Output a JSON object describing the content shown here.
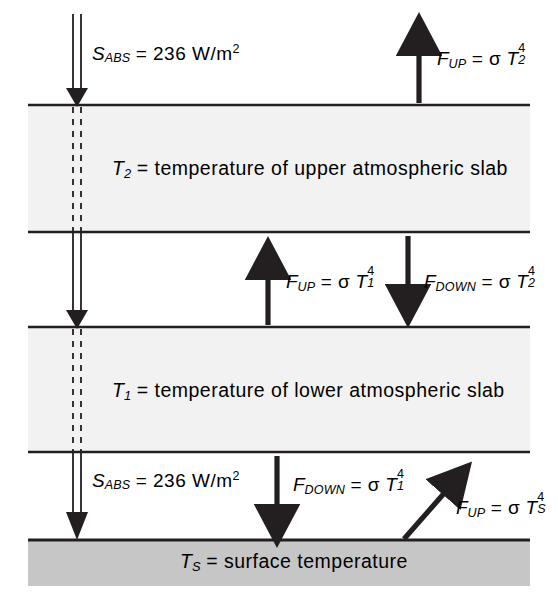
{
  "figure": {
    "type": "two-slab-atmosphere-energy-balance-diagram",
    "background_color": "#ffffff",
    "line_color": "#231f20",
    "slab_fill_color": "#f2f2f2",
    "surface_fill_color": "#c6c6c6"
  },
  "layers": {
    "upper_slab": {
      "name": "upper atmospheric slab",
      "label_symbol": "T",
      "label_subscript": "2",
      "label_text": "= temperature of upper atmospheric slab",
      "full_text": "T2 = temperature of upper atmospheric slab",
      "top_y": 105,
      "bottom_y": 232
    },
    "lower_slab": {
      "name": "lower atmospheric slab",
      "label_symbol": "T",
      "label_subscript": "1",
      "label_text": "= temperature of lower atmospheric slab",
      "full_text": "T1 = temperature of lower atmospheric slab",
      "top_y": 327,
      "bottom_y": 452
    },
    "surface": {
      "name": "surface",
      "label_symbol": "T",
      "label_subscript": "S",
      "label_text": "= surface temperature",
      "full_text": "TS = surface temperature",
      "top_y": 540,
      "bottom_y": 586
    }
  },
  "fluxes": [
    {
      "id": "solar-top",
      "symbol": "S",
      "subscript": "ABS",
      "equals": "=",
      "value": "236",
      "units": "W/m",
      "units_exponent": "2",
      "full_text": "SABS = 236 W/m2",
      "direction": "down",
      "arrow_style": "double-line",
      "location": "top-of-atmosphere"
    },
    {
      "id": "fup-toa",
      "symbol": "F",
      "subscript": "UP",
      "equals": "=",
      "sigma": "σ",
      "temp_symbol": "T",
      "temp_subscript": "2",
      "temp_exponent": "4",
      "full_text": "FUP = σ T2^4",
      "direction": "up",
      "arrow_style": "solid",
      "location": "top-of-upper-slab"
    },
    {
      "id": "fup-mid",
      "symbol": "F",
      "subscript": "UP",
      "equals": "=",
      "sigma": "σ",
      "temp_symbol": "T",
      "temp_subscript": "1",
      "temp_exponent": "4",
      "full_text": "FUP = σ T1^4",
      "direction": "up",
      "arrow_style": "solid",
      "location": "between-slabs"
    },
    {
      "id": "fdown-mid",
      "symbol": "F",
      "subscript": "DOWN",
      "equals": "=",
      "sigma": "σ",
      "temp_symbol": "T",
      "temp_subscript": "2",
      "temp_exponent": "4",
      "full_text": "FDOWN = σ T2^4",
      "direction": "down",
      "arrow_style": "solid",
      "location": "between-slabs"
    },
    {
      "id": "solar-surface",
      "symbol": "S",
      "subscript": "ABS",
      "equals": "=",
      "value": "236",
      "units": "W/m",
      "units_exponent": "2",
      "full_text": "SABS = 236 W/m2",
      "direction": "down",
      "arrow_style": "double-line",
      "location": "above-surface"
    },
    {
      "id": "fdown-surface",
      "symbol": "F",
      "subscript": "DOWN",
      "equals": "=",
      "sigma": "σ",
      "temp_symbol": "T",
      "temp_subscript": "1",
      "temp_exponent": "4",
      "full_text": "FDOWN = σ T1^4",
      "direction": "down",
      "arrow_style": "solid",
      "location": "above-surface"
    },
    {
      "id": "fup-surface",
      "symbol": "F",
      "subscript": "UP",
      "equals": "=",
      "sigma": "σ",
      "temp_symbol": "T",
      "temp_subscript": "S",
      "temp_exponent": "4",
      "full_text": "FUP = σ TS^4",
      "direction": "up-right-diagonal",
      "arrow_style": "solid",
      "location": "from-surface"
    }
  ]
}
